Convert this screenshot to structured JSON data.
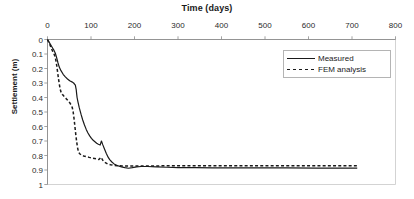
{
  "chart_data": {
    "type": "line",
    "title": "Time (days)",
    "xlabel": "Time (days)",
    "ylabel": "Settlement (m)",
    "xlim": [
      0,
      800
    ],
    "ylim": [
      0,
      1
    ],
    "y_inverted": true,
    "xticks": [
      0,
      100,
      200,
      300,
      400,
      500,
      600,
      700,
      800
    ],
    "yticks": [
      0,
      0.1,
      0.2,
      0.3,
      0.4,
      0.5,
      0.6,
      0.7,
      0.8,
      0.9,
      1
    ],
    "xtick_labels": [
      "0",
      "100",
      "200",
      "300",
      "400",
      "500",
      "600",
      "700",
      "800"
    ],
    "ytick_labels": [
      "0",
      "0.1",
      "0.2",
      "0.3",
      "0.4",
      "0.5",
      "0.6",
      "0.7",
      "0.8",
      "0.9",
      "1"
    ],
    "grid": false,
    "x_axis_position": "top",
    "legend_position": "upper right",
    "series": [
      {
        "name": "Measured",
        "style": "solid",
        "color": "#1a1a1a",
        "points": [
          [
            0,
            0.0
          ],
          [
            3,
            0.015
          ],
          [
            6,
            0.03
          ],
          [
            9,
            0.045
          ],
          [
            12,
            0.06
          ],
          [
            15,
            0.075
          ],
          [
            18,
            0.095
          ],
          [
            21,
            0.125
          ],
          [
            24,
            0.16
          ],
          [
            27,
            0.19
          ],
          [
            31,
            0.215
          ],
          [
            36,
            0.24
          ],
          [
            41,
            0.258
          ],
          [
            46,
            0.272
          ],
          [
            51,
            0.285
          ],
          [
            56,
            0.292
          ],
          [
            60,
            0.3
          ],
          [
            64,
            0.315
          ],
          [
            66,
            0.345
          ],
          [
            67,
            0.375
          ],
          [
            68,
            0.4
          ],
          [
            70,
            0.43
          ],
          [
            73,
            0.47
          ],
          [
            77,
            0.515
          ],
          [
            81,
            0.555
          ],
          [
            85,
            0.59
          ],
          [
            89,
            0.62
          ],
          [
            93,
            0.645
          ],
          [
            97,
            0.665
          ],
          [
            101,
            0.682
          ],
          [
            105,
            0.695
          ],
          [
            109,
            0.705
          ],
          [
            113,
            0.715
          ],
          [
            117,
            0.722
          ],
          [
            121,
            0.728
          ],
          [
            124,
            0.7
          ],
          [
            127,
            0.725
          ],
          [
            131,
            0.755
          ],
          [
            135,
            0.785
          ],
          [
            139,
            0.81
          ],
          [
            143,
            0.828
          ],
          [
            148,
            0.845
          ],
          [
            153,
            0.858
          ],
          [
            158,
            0.866
          ],
          [
            163,
            0.872
          ],
          [
            170,
            0.878
          ],
          [
            178,
            0.884
          ],
          [
            186,
            0.888
          ],
          [
            195,
            0.884
          ],
          [
            205,
            0.878
          ],
          [
            215,
            0.876
          ],
          [
            230,
            0.876
          ],
          [
            250,
            0.878
          ],
          [
            275,
            0.881
          ],
          [
            300,
            0.883
          ],
          [
            340,
            0.884
          ],
          [
            380,
            0.885
          ],
          [
            430,
            0.885
          ],
          [
            490,
            0.886
          ],
          [
            550,
            0.886
          ],
          [
            620,
            0.887
          ],
          [
            680,
            0.887
          ],
          [
            712,
            0.887
          ]
        ]
      },
      {
        "name": "FEM analysis",
        "style": "dashed",
        "color": "#1a1a1a",
        "points": [
          [
            0,
            0.0
          ],
          [
            3,
            0.02
          ],
          [
            6,
            0.04
          ],
          [
            9,
            0.062
          ],
          [
            12,
            0.082
          ],
          [
            15,
            0.1
          ],
          [
            17,
            0.115
          ],
          [
            19,
            0.14
          ],
          [
            21,
            0.175
          ],
          [
            23,
            0.22
          ],
          [
            25,
            0.265
          ],
          [
            27,
            0.305
          ],
          [
            29,
            0.34
          ],
          [
            31,
            0.362
          ],
          [
            34,
            0.378
          ],
          [
            38,
            0.392
          ],
          [
            43,
            0.408
          ],
          [
            48,
            0.425
          ],
          [
            52,
            0.44
          ],
          [
            55,
            0.455
          ],
          [
            57,
            0.47
          ],
          [
            59,
            0.5
          ],
          [
            61,
            0.545
          ],
          [
            63,
            0.6
          ],
          [
            65,
            0.655
          ],
          [
            67,
            0.705
          ],
          [
            69,
            0.745
          ],
          [
            71,
            0.772
          ],
          [
            74,
            0.788
          ],
          [
            78,
            0.797
          ],
          [
            83,
            0.803
          ],
          [
            89,
            0.808
          ],
          [
            96,
            0.813
          ],
          [
            104,
            0.818
          ],
          [
            112,
            0.823
          ],
          [
            118,
            0.828
          ],
          [
            123,
            0.812
          ],
          [
            127,
            0.832
          ],
          [
            132,
            0.848
          ],
          [
            138,
            0.858
          ],
          [
            145,
            0.864
          ],
          [
            153,
            0.868
          ],
          [
            162,
            0.87
          ],
          [
            172,
            0.872
          ],
          [
            185,
            0.873
          ],
          [
            200,
            0.873
          ],
          [
            220,
            0.872
          ],
          [
            245,
            0.872
          ],
          [
            275,
            0.871
          ],
          [
            310,
            0.871
          ],
          [
            350,
            0.871
          ],
          [
            400,
            0.87
          ],
          [
            455,
            0.87
          ],
          [
            515,
            0.87
          ],
          [
            575,
            0.87
          ],
          [
            635,
            0.87
          ],
          [
            690,
            0.87
          ],
          [
            716,
            0.87
          ]
        ]
      }
    ]
  },
  "legend": {
    "items": [
      {
        "label": "Measured",
        "style": "solid"
      },
      {
        "label": "FEM analysis",
        "style": "dashed"
      }
    ]
  }
}
